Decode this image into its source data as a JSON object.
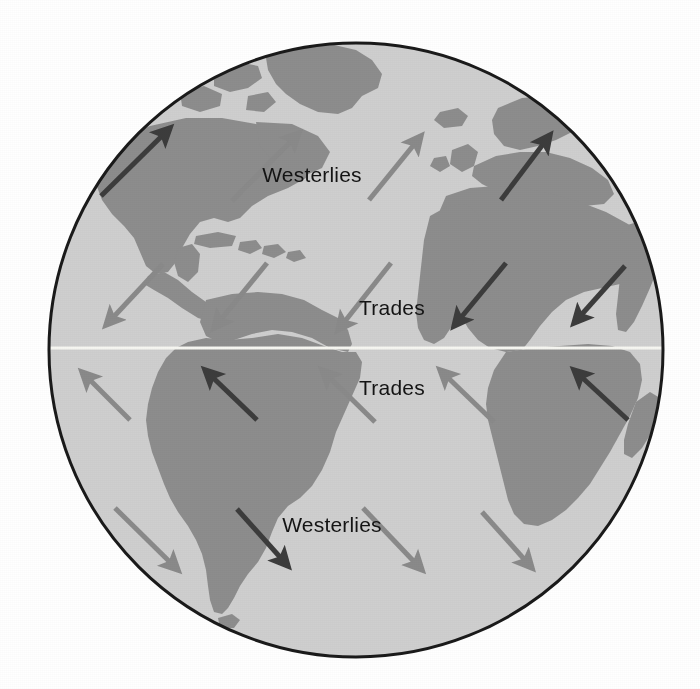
{
  "diagram": {
    "type": "globe-map",
    "projection": "orthographic",
    "background_color": "#ffffff"
  },
  "globe": {
    "center_x": 356,
    "center_y": 350,
    "radius": 307,
    "ocean_color": "#cfcfcf",
    "land_color": "#8d8d8d",
    "outline_color": "#1a1a1a",
    "outline_width": 3
  },
  "equator": {
    "label": "equator",
    "color": "#f7f7f2",
    "y": 348,
    "width": 3
  },
  "legend_colors": {
    "arrow_light": "#8a8a8a",
    "arrow_dark": "#3c3c3c",
    "land": "#8d8d8d",
    "ocean": "#cfcfcf",
    "equator_line": "#f7f7f2"
  },
  "labels": [
    {
      "id": "westerlies-north",
      "text": "Westerlies",
      "x": 312,
      "y": 182,
      "anchor": "middle"
    },
    {
      "id": "trades-north",
      "text": "Trades",
      "x": 392,
      "y": 315,
      "anchor": "middle"
    },
    {
      "id": "trades-south",
      "text": "Trades",
      "x": 392,
      "y": 395,
      "anchor": "middle"
    },
    {
      "id": "westerlies-south",
      "text": "Westerlies",
      "x": 332,
      "y": 532,
      "anchor": "middle"
    }
  ],
  "wind_belts": [
    {
      "name": "Westerlies",
      "hemisphere": "north",
      "latitude_band": "30N-60N",
      "direction": "southwest to northeast",
      "arrow_count": 3
    },
    {
      "name": "Trades",
      "hemisphere": "north",
      "latitude_band": "0-30N",
      "direction": "northeast to southwest",
      "arrow_count": 5
    },
    {
      "name": "Trades",
      "hemisphere": "south",
      "latitude_band": "0-30S",
      "direction": "southeast to northwest",
      "arrow_count": 5
    },
    {
      "name": "Westerlies",
      "hemisphere": "south",
      "latitude_band": "30S-60S",
      "direction": "northwest to southeast",
      "arrow_count": 4
    }
  ],
  "arrows": [
    {
      "id": "a01",
      "belt": "Westerlies N",
      "tone": "dark",
      "x1": 101,
      "y1": 196,
      "x2": 172,
      "y2": 127
    },
    {
      "id": "a02",
      "belt": "Westerlies N",
      "tone": "light",
      "x1": 232,
      "y1": 201,
      "x2": 301,
      "y2": 132
    },
    {
      "id": "a03",
      "belt": "Westerlies N",
      "tone": "light",
      "x1": 369,
      "y1": 200,
      "x2": 423,
      "y2": 135
    },
    {
      "id": "a04",
      "belt": "Westerlies N",
      "tone": "dark",
      "x1": 500,
      "y1": 200,
      "x2": 552,
      "y2": 134
    },
    {
      "id": "a05",
      "belt": "Trades N",
      "tone": "light",
      "x1": 163,
      "y1": 264,
      "x2": 104,
      "y2": 327
    },
    {
      "id": "a06",
      "belt": "Trades N",
      "tone": "light",
      "x1": 267,
      "y1": 263,
      "x2": 212,
      "y2": 330
    },
    {
      "id": "a07",
      "belt": "Trades N",
      "tone": "light",
      "x1": 391,
      "y1": 263,
      "x2": 336,
      "y2": 332
    },
    {
      "id": "a08",
      "belt": "Trades N",
      "tone": "dark",
      "x1": 506,
      "y1": 263,
      "x2": 452,
      "y2": 328
    },
    {
      "id": "a09",
      "belt": "Trades N",
      "tone": "dark",
      "x1": 625,
      "y1": 266,
      "x2": 572,
      "y2": 325
    },
    {
      "id": "a10",
      "belt": "Trades S",
      "tone": "light",
      "x1": 130,
      "y1": 420,
      "x2": 80,
      "y2": 370
    },
    {
      "id": "a11",
      "belt": "Trades S",
      "tone": "dark",
      "x1": 257,
      "y1": 420,
      "x2": 203,
      "y2": 368
    },
    {
      "id": "a12",
      "belt": "Trades S",
      "tone": "light",
      "x1": 375,
      "y1": 422,
      "x2": 320,
      "y2": 368
    },
    {
      "id": "a13",
      "belt": "Trades S",
      "tone": "light",
      "x1": 494,
      "y1": 422,
      "x2": 438,
      "y2": 368
    },
    {
      "id": "a14",
      "belt": "Trades S",
      "tone": "dark",
      "x1": 628,
      "y1": 420,
      "x2": 572,
      "y2": 368
    },
    {
      "id": "a15",
      "belt": "Westerlies S",
      "tone": "light",
      "x1": 115,
      "y1": 508,
      "x2": 180,
      "y2": 572
    },
    {
      "id": "a16",
      "belt": "Westerlies S",
      "tone": "dark",
      "x1": 237,
      "y1": 509,
      "x2": 290,
      "y2": 568
    },
    {
      "id": "a17",
      "belt": "Westerlies S",
      "tone": "light",
      "x1": 363,
      "y1": 508,
      "x2": 424,
      "y2": 572
    },
    {
      "id": "a18",
      "belt": "Westerlies S",
      "tone": "light",
      "x1": 482,
      "y1": 512,
      "x2": 534,
      "y2": 570
    }
  ],
  "landmasses": [
    {
      "name": "Greenland"
    },
    {
      "name": "North America"
    },
    {
      "name": "Caribbean islands"
    },
    {
      "name": "South America"
    },
    {
      "name": "Europe"
    },
    {
      "name": "Africa"
    },
    {
      "name": "Madagascar"
    },
    {
      "name": "Iceland"
    }
  ]
}
